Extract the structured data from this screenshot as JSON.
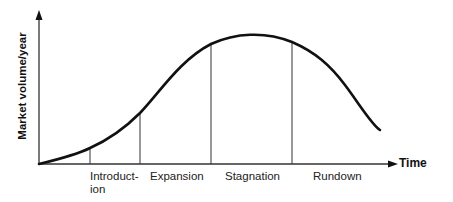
{
  "diagram": {
    "type": "product-life-cycle-curve",
    "y_axis_label": "Market volume/year",
    "x_axis_label": "Time",
    "phases": [
      {
        "label_line1": "Introduct-",
        "label_line2": "ion"
      },
      {
        "label_line1": "Expansion",
        "label_line2": ""
      },
      {
        "label_line1": "Stagnation",
        "label_line2": ""
      },
      {
        "label_line1": "Rundown",
        "label_line2": ""
      }
    ],
    "colors": {
      "line": "#111111",
      "background": "#ffffff"
    }
  }
}
